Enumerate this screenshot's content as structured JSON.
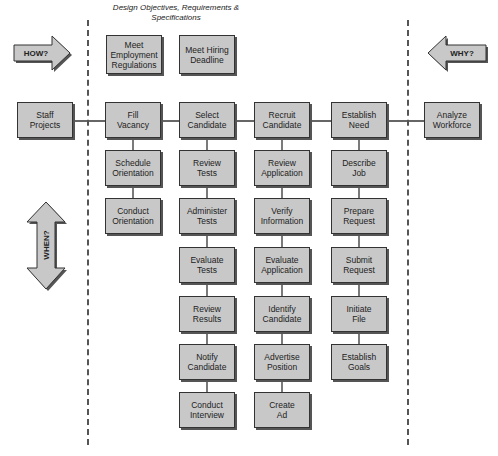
{
  "header": {
    "title": "Design Objectives, Requirements & Specifications"
  },
  "arrows": {
    "how": "HOW?",
    "why": "WHY?",
    "when": "WHEN?"
  },
  "objectives": [
    {
      "label": "Meet\nEmployment\nRegulations"
    },
    {
      "label": "Meet Hiring\nDeadline"
    }
  ],
  "main_row": [
    {
      "label": "Staff\nProjects"
    },
    {
      "label": "Fill\nVacancy"
    },
    {
      "label": "Select\nCandidate"
    },
    {
      "label": "Recruit\nCandidate"
    },
    {
      "label": "Establish\nNeed"
    },
    {
      "label": "Analyze\nWorkforce"
    }
  ],
  "columns": {
    "fill_vacancy": [
      {
        "label": "Schedule\nOrientation"
      },
      {
        "label": "Conduct\nOrientation"
      }
    ],
    "select_candidate": [
      {
        "label": "Review\nTests"
      },
      {
        "label": "Administer\nTests"
      },
      {
        "label": "Evaluate\nTests"
      },
      {
        "label": "Review\nResults"
      },
      {
        "label": "Notify\nCandidate"
      },
      {
        "label": "Conduct\nInterview"
      }
    ],
    "recruit_candidate": [
      {
        "label": "Review\nApplication"
      },
      {
        "label": "Verify\nInformation"
      },
      {
        "label": "Evaluate\nApplication"
      },
      {
        "label": "Identify\nCandidate"
      },
      {
        "label": "Advertise\nPosition"
      },
      {
        "label": "Create\nAd"
      }
    ],
    "establish_need": [
      {
        "label": "Describe\nJob"
      },
      {
        "label": "Prepare\nRequest"
      },
      {
        "label": "Submit\nRequest"
      },
      {
        "label": "Initiate\nFile"
      },
      {
        "label": "Establish\nGoals"
      }
    ]
  },
  "colors": {
    "box_fill": "#c8c8c8",
    "box_border": "#333333",
    "arrow_fill": "#c8c8c8",
    "line": "#333333"
  }
}
